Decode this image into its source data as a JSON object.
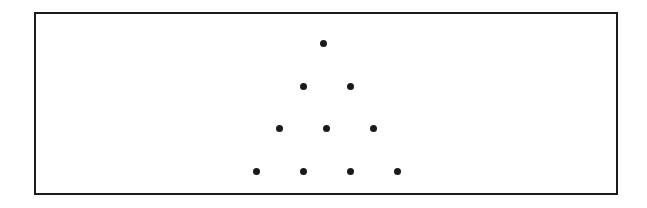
{
  "figure": {
    "background_color": "#ffffff",
    "canvas": {
      "width": 647,
      "height": 208
    }
  },
  "frame": {
    "name": "rectangular border",
    "x": 34,
    "y": 12,
    "width": 584,
    "height": 183,
    "border_width": 2,
    "border_color": "#1c1c1c",
    "fill_color": "#ffffff"
  },
  "dots": {
    "count": 10,
    "color": "#1a1a1a",
    "diameter": 7,
    "row_counts": [
      1,
      2,
      3,
      4
    ],
    "row_spacing": 43,
    "column_spacing": 47,
    "items": [
      {
        "label": "row1-dot1",
        "row": 1,
        "index": 1,
        "cx": 323,
        "cy": 43
      },
      {
        "label": "row2-dot1",
        "row": 2,
        "index": 1,
        "cx": 303,
        "cy": 86
      },
      {
        "label": "row2-dot2",
        "row": 2,
        "index": 2,
        "cx": 350,
        "cy": 86
      },
      {
        "label": "row3-dot1",
        "row": 3,
        "index": 1,
        "cx": 279,
        "cy": 128
      },
      {
        "label": "row3-dot2",
        "row": 3,
        "index": 2,
        "cx": 326,
        "cy": 128
      },
      {
        "label": "row3-dot3",
        "row": 3,
        "index": 3,
        "cx": 373,
        "cy": 128
      },
      {
        "label": "row4-dot1",
        "row": 4,
        "index": 1,
        "cx": 256,
        "cy": 171
      },
      {
        "label": "row4-dot2",
        "row": 4,
        "index": 2,
        "cx": 303,
        "cy": 171
      },
      {
        "label": "row4-dot3",
        "row": 4,
        "index": 3,
        "cx": 350,
        "cy": 171
      },
      {
        "label": "row4-dot4",
        "row": 4,
        "index": 4,
        "cx": 397,
        "cy": 171
      }
    ]
  }
}
